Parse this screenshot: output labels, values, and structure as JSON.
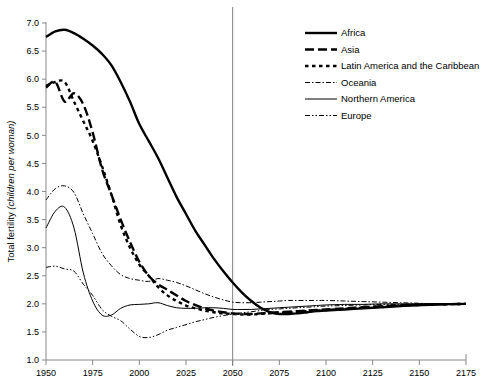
{
  "chart_data": {
    "type": "line",
    "title": "",
    "xlabel": "",
    "ylabel": "Total fertility (children per woman)",
    "ylabel_prefix": "Total fertility ",
    "ylabel_italic": "(children per woman)",
    "xlim": [
      1950,
      2175
    ],
    "ylim": [
      1.0,
      7.0
    ],
    "grid": false,
    "legend_position": "top-right",
    "xticks": [
      "1950",
      "1975",
      "2000",
      "2025",
      "2050",
      "2075",
      "2100",
      "2125",
      "2150",
      "2175"
    ],
    "xtick_values": [
      1950,
      1975,
      2000,
      2025,
      2050,
      2075,
      2100,
      2125,
      2150,
      2175
    ],
    "yticks": [
      "1.0",
      "1.5",
      "2.0",
      "2.5",
      "3.0",
      "3.5",
      "4.0",
      "4.5",
      "5.0",
      "5.5",
      "6.0",
      "6.5",
      "7.0"
    ],
    "ytick_values": [
      1.0,
      1.5,
      2.0,
      2.5,
      3.0,
      3.5,
      4.0,
      4.5,
      5.0,
      5.5,
      6.0,
      6.5,
      7.0
    ],
    "annotations": [
      {
        "name": "projection-divider",
        "type": "vline",
        "x": 2050,
        "color": "#808080"
      }
    ],
    "x": [
      1950,
      1955,
      1960,
      1965,
      1970,
      1975,
      1980,
      1985,
      1990,
      1995,
      2000,
      2005,
      2010,
      2015,
      2020,
      2025,
      2030,
      2035,
      2040,
      2045,
      2050,
      2055,
      2060,
      2065,
      2070,
      2075,
      2080,
      2085,
      2090,
      2095,
      2100,
      2110,
      2120,
      2130,
      2140,
      2150,
      2160,
      2175
    ],
    "series": [
      {
        "name": "Africa",
        "style": "solid-thick",
        "color": "#000000",
        "values": [
          6.75,
          6.85,
          6.88,
          6.82,
          6.72,
          6.6,
          6.45,
          6.25,
          5.95,
          5.6,
          5.2,
          4.9,
          4.6,
          4.25,
          3.9,
          3.6,
          3.3,
          3.05,
          2.8,
          2.58,
          2.38,
          2.2,
          2.05,
          1.93,
          1.85,
          1.82,
          1.82,
          1.83,
          1.85,
          1.87,
          1.88,
          1.9,
          1.92,
          1.94,
          1.96,
          1.98,
          1.99,
          2.0
        ]
      },
      {
        "name": "Asia",
        "style": "dashed-thick",
        "color": "#000000",
        "values": [
          5.85,
          5.95,
          5.6,
          5.75,
          5.55,
          5.05,
          4.4,
          3.95,
          3.5,
          3.1,
          2.75,
          2.5,
          2.35,
          2.25,
          2.15,
          2.05,
          1.98,
          1.92,
          1.88,
          1.85,
          1.83,
          1.82,
          1.82,
          1.83,
          1.84,
          1.85,
          1.86,
          1.87,
          1.88,
          1.89,
          1.9,
          1.92,
          1.94,
          1.96,
          1.97,
          1.98,
          1.99,
          2.0
        ]
      },
      {
        "name": "Latin America and the Caribbean",
        "style": "dotted-thick",
        "color": "#000000",
        "values": [
          5.88,
          5.95,
          5.95,
          5.6,
          5.25,
          4.9,
          4.45,
          3.95,
          3.4,
          3.0,
          2.7,
          2.5,
          2.3,
          2.15,
          2.05,
          1.97,
          1.92,
          1.88,
          1.85,
          1.83,
          1.82,
          1.81,
          1.81,
          1.82,
          1.83,
          1.84,
          1.85,
          1.86,
          1.87,
          1.88,
          1.89,
          1.91,
          1.93,
          1.95,
          1.97,
          1.98,
          1.99,
          2.0
        ]
      },
      {
        "name": "Oceania",
        "style": "dashdot-thin",
        "color": "#000000",
        "values": [
          3.85,
          4.05,
          4.1,
          3.98,
          3.6,
          3.25,
          2.9,
          2.68,
          2.52,
          2.45,
          2.42,
          2.4,
          2.45,
          2.42,
          2.38,
          2.32,
          2.25,
          2.18,
          2.12,
          2.07,
          2.03,
          2.02,
          2.02,
          2.03,
          2.04,
          2.05,
          2.06,
          2.06,
          2.06,
          2.06,
          2.06,
          2.05,
          2.04,
          2.03,
          2.02,
          2.01,
          2.0,
          2.0
        ]
      },
      {
        "name": "Northern America",
        "style": "solid-thin",
        "color": "#000000",
        "values": [
          3.35,
          3.65,
          3.72,
          3.35,
          2.55,
          2.05,
          1.8,
          1.8,
          1.92,
          1.98,
          1.99,
          2.0,
          2.02,
          1.97,
          1.93,
          1.92,
          1.92,
          1.93,
          1.93,
          1.92,
          1.9,
          1.9,
          1.9,
          1.91,
          1.92,
          1.93,
          1.94,
          1.95,
          1.96,
          1.97,
          1.98,
          1.99,
          1.99,
          2.0,
          2.0,
          2.0,
          2.0,
          2.0
        ]
      },
      {
        "name": "Europe",
        "style": "dashdotdot-thin",
        "color": "#000000",
        "values": [
          2.65,
          2.67,
          2.62,
          2.58,
          2.35,
          2.15,
          1.9,
          1.78,
          1.7,
          1.55,
          1.42,
          1.4,
          1.45,
          1.53,
          1.58,
          1.63,
          1.68,
          1.72,
          1.76,
          1.79,
          1.82,
          1.84,
          1.86,
          1.88,
          1.9,
          1.91,
          1.92,
          1.93,
          1.94,
          1.95,
          1.96,
          1.97,
          1.98,
          1.99,
          1.99,
          2.0,
          2.0,
          2.0
        ]
      }
    ]
  },
  "legend": {
    "items": [
      {
        "label": "Africa",
        "style": "solid-thick"
      },
      {
        "label": "Asia",
        "style": "dashed-thick"
      },
      {
        "label": "Latin America and the Caribbean",
        "style": "dotted-thick"
      },
      {
        "label": "Oceania",
        "style": "dashdot-thin"
      },
      {
        "label": "Northern America",
        "style": "solid-thin"
      },
      {
        "label": "Europe",
        "style": "dashdotdot-thin"
      }
    ]
  },
  "header": {
    "cropped_title": ""
  }
}
